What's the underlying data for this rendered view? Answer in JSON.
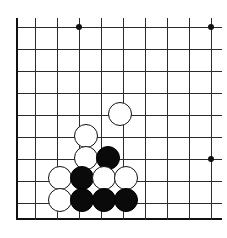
{
  "board": {
    "name": "go-board",
    "type": "go-goban-diagram",
    "background_color": "#ffffff",
    "line_color": "#2b2b2b",
    "edge_color": "#111111",
    "black_color": "#0a0a0a",
    "white_color": "#ffffff",
    "grid_spacing_px": 22,
    "stone_radius_px": 11,
    "origin": {
      "x": 16,
      "y": 27
    },
    "vertical_lines_x": [
      16,
      35,
      57,
      79,
      101,
      123,
      145,
      167,
      189,
      211
    ],
    "horizontal_lines_y": [
      27,
      49,
      71,
      93,
      115,
      137,
      159,
      181,
      203,
      218
    ],
    "left_edge": {
      "x": 16,
      "y_top": 18,
      "y_bottom": 220,
      "thick": true
    },
    "bottom_edge": {
      "y": 218,
      "x_left": 16,
      "x_right": 222,
      "thick": true
    },
    "star_points": [
      {
        "name": "star-point-top-left",
        "x": 79,
        "y": 27
      },
      {
        "name": "star-point-top-right",
        "x": 211,
        "y": 27
      },
      {
        "name": "star-point-right",
        "x": 211,
        "y": 159
      }
    ],
    "stones": [
      {
        "name": "stone-white-1",
        "color": "white",
        "x": 120,
        "y": 114,
        "r": 12
      },
      {
        "name": "stone-white-2",
        "color": "white",
        "x": 86,
        "y": 136,
        "r": 12
      },
      {
        "name": "stone-white-3",
        "color": "white",
        "x": 86,
        "y": 158,
        "r": 12
      },
      {
        "name": "stone-black-1",
        "color": "black",
        "x": 108,
        "y": 158,
        "r": 12
      },
      {
        "name": "stone-white-4",
        "color": "white",
        "x": 60,
        "y": 178,
        "r": 12
      },
      {
        "name": "stone-black-2",
        "color": "black",
        "x": 82,
        "y": 178,
        "r": 12
      },
      {
        "name": "stone-white-5",
        "color": "white",
        "x": 104,
        "y": 178,
        "r": 12
      },
      {
        "name": "stone-white-6",
        "color": "white",
        "x": 126,
        "y": 178,
        "r": 12
      },
      {
        "name": "stone-white-7",
        "color": "white",
        "x": 60,
        "y": 200,
        "r": 12
      },
      {
        "name": "stone-black-3",
        "color": "black",
        "x": 82,
        "y": 200,
        "r": 12
      },
      {
        "name": "stone-black-4",
        "color": "black",
        "x": 104,
        "y": 200,
        "r": 12
      },
      {
        "name": "stone-black-5",
        "color": "black",
        "x": 126,
        "y": 200,
        "r": 12
      }
    ]
  }
}
